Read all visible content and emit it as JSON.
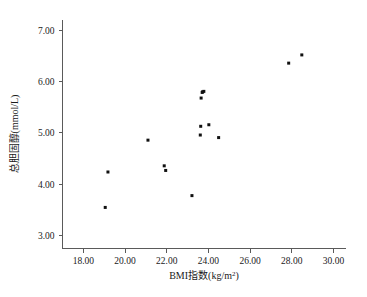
{
  "chart_data": {
    "type": "scatter",
    "title": "",
    "xlabel": "BMI指数(kg/m²)",
    "xlabel_base": "BMI指数(kg/m",
    "xlabel_sup": "2",
    "xlabel_tail": ")",
    "ylabel": "总胆固醇(mmol/L)",
    "xlim": [
      17.0,
      30.6
    ],
    "ylim": [
      2.75,
      7.2
    ],
    "xticks": [
      18.0,
      20.0,
      22.0,
      24.0,
      26.0,
      28.0,
      30.0
    ],
    "xticklabels": [
      "18.00",
      "20.00",
      "22.00",
      "24.00",
      "26.00",
      "28.00",
      "30.00"
    ],
    "yticks": [
      3.0,
      4.0,
      5.0,
      6.0,
      7.0
    ],
    "yticklabels": [
      "3.00",
      "4.00",
      "5.00",
      "6.00",
      "7.00"
    ],
    "grid": false,
    "legend": null,
    "marker": "square",
    "marker_color": "#111111",
    "marker_size_px": 3,
    "n_points": 16,
    "x": [
      19.05,
      19.18,
      21.1,
      21.88,
      21.95,
      23.21,
      23.61,
      23.63,
      23.72,
      23.65,
      23.78,
      23.7,
      24.02,
      24.49,
      27.85,
      28.48
    ],
    "y": [
      3.55,
      4.24,
      4.86,
      4.36,
      4.27,
      3.78,
      4.96,
      5.13,
      5.8,
      5.68,
      5.81,
      5.79,
      5.16,
      4.91,
      6.36,
      6.52
    ],
    "points": [
      {
        "x": 19.05,
        "y": 3.55
      },
      {
        "x": 19.18,
        "y": 4.24
      },
      {
        "x": 21.1,
        "y": 4.86
      },
      {
        "x": 21.88,
        "y": 4.36
      },
      {
        "x": 21.95,
        "y": 4.27
      },
      {
        "x": 23.21,
        "y": 3.78
      },
      {
        "x": 23.61,
        "y": 4.96
      },
      {
        "x": 23.63,
        "y": 5.13
      },
      {
        "x": 23.72,
        "y": 5.8
      },
      {
        "x": 23.65,
        "y": 5.68
      },
      {
        "x": 23.78,
        "y": 5.81
      },
      {
        "x": 23.7,
        "y": 5.79
      },
      {
        "x": 24.02,
        "y": 5.16
      },
      {
        "x": 24.49,
        "y": 4.91
      },
      {
        "x": 27.85,
        "y": 6.36
      },
      {
        "x": 28.48,
        "y": 6.52
      }
    ]
  },
  "axes": {
    "x_axis_name": "bmi-axis",
    "y_axis_name": "cholesterol-axis"
  }
}
